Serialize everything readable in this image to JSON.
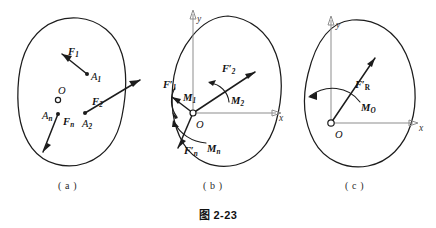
{
  "figure": {
    "caption": "图 2-23",
    "panels": [
      {
        "id": "a",
        "label": "( a )",
        "description": "original force system acting at points on a rigid body",
        "center_label": "O",
        "items": [
          {
            "force": "F",
            "force_sub": "1",
            "point": "A",
            "point_sub": "1"
          },
          {
            "force": "F",
            "force_sub": "2",
            "point": "A",
            "point_sub": "2"
          },
          {
            "force": "F",
            "force_sub": "n",
            "point": "A",
            "point_sub": "n"
          }
        ]
      },
      {
        "id": "b",
        "label": "( b )",
        "description": "forces translated to origin with accompanying couples",
        "origin_label": "O",
        "axis_x": "x",
        "axis_y": "y",
        "items": [
          {
            "force": "F",
            "force_sub": "1",
            "primed": true,
            "moment": "M",
            "moment_sub": "1"
          },
          {
            "force": "F",
            "force_sub": "2",
            "primed": true,
            "moment": "M",
            "moment_sub": "2"
          },
          {
            "force": "F",
            "force_sub": "n",
            "primed": true,
            "moment": "M",
            "moment_sub": "n"
          }
        ]
      },
      {
        "id": "c",
        "label": "( c )",
        "description": "resultant force and resultant couple at origin",
        "origin_label": "O",
        "axis_x": "x",
        "axis_y": "y",
        "items": [
          {
            "force": "F",
            "force_sub": "R",
            "primed": true,
            "moment": "M",
            "moment_sub": "O"
          }
        ]
      }
    ],
    "colors": {
      "ink": "#1c1c1c",
      "axis": "#8d8d8d",
      "background": "#ffffff"
    }
  },
  "labels": {
    "a": {
      "F1": "F",
      "F1s": "1",
      "A1": "A",
      "A1s": "1",
      "F2": "F",
      "F2s": "2",
      "A2": "A",
      "A2s": "2",
      "Fn": "F",
      "Fns": "n",
      "An": "A",
      "Ans": "n",
      "O": "O",
      "cap": "( a )"
    },
    "b": {
      "F1": "F",
      "F1s": "1",
      "M1": "M",
      "M1s": "1",
      "F2": "F",
      "F2s": "2",
      "M2": "M",
      "M2s": "2",
      "Fn": "F",
      "Fns": "n",
      "Mn": "M",
      "Mns": "n",
      "O": "O",
      "x": "x",
      "y": "y",
      "cap": "( b )"
    },
    "c": {
      "FR": "F",
      "FRs": "R",
      "MO": "M",
      "MOs": "O",
      "O": "O",
      "x": "x",
      "y": "y",
      "cap": "( c )"
    },
    "caption": "图 2-23"
  }
}
